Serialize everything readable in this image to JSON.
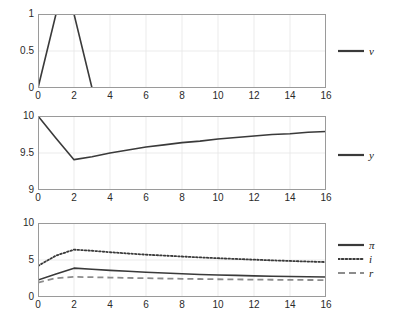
{
  "figure": {
    "background": "#ffffff",
    "line_color": "#3a3a3a",
    "grid_color": "#e6e6e6",
    "axis_color": "#9a9a9a",
    "text_color": "#2a2a2a"
  },
  "chart_data": [
    {
      "type": "line",
      "panel": "top",
      "title": "",
      "xlabel": "",
      "ylabel": "",
      "xlim": [
        0,
        16
      ],
      "ylim": [
        0,
        1
      ],
      "xticks": [
        0,
        2,
        4,
        6,
        8,
        10,
        12,
        14,
        16
      ],
      "yticks": [
        0,
        0.5,
        1
      ],
      "xticklabels": [
        "0",
        "2",
        "4",
        "6",
        "8",
        "10",
        "12",
        "14",
        "16"
      ],
      "yticklabels": [
        "0",
        "0.5",
        "1"
      ],
      "grid": true,
      "legend_position": "right",
      "series": [
        {
          "name": "v",
          "label": "v",
          "style": "solid",
          "color": "#3a3a3a",
          "x": [
            0,
            1,
            2,
            3,
            4,
            5,
            6,
            7,
            8,
            9,
            10,
            11,
            12,
            13,
            14,
            15,
            16
          ],
          "values": [
            0,
            1,
            1,
            0,
            0,
            0,
            0,
            0,
            0,
            0,
            0,
            0,
            0,
            0,
            0,
            0,
            0
          ]
        }
      ]
    },
    {
      "type": "line",
      "panel": "middle",
      "title": "",
      "xlabel": "",
      "ylabel": "",
      "xlim": [
        0,
        16
      ],
      "ylim": [
        9,
        10
      ],
      "xticks": [
        0,
        2,
        4,
        6,
        8,
        10,
        12,
        14,
        16
      ],
      "yticks": [
        9,
        9.5,
        10
      ],
      "xticklabels": [
        "0",
        "2",
        "4",
        "6",
        "8",
        "10",
        "12",
        "14",
        "16"
      ],
      "yticklabels": [
        "9",
        "9.5",
        "10"
      ],
      "grid": true,
      "legend_position": "right",
      "series": [
        {
          "name": "y",
          "label": "y",
          "style": "solid",
          "color": "#3a3a3a",
          "x": [
            0,
            1,
            2,
            3,
            4,
            5,
            6,
            7,
            8,
            9,
            10,
            11,
            12,
            13,
            14,
            15,
            16
          ],
          "values": [
            10.0,
            9.7,
            9.41,
            9.45,
            9.5,
            9.54,
            9.58,
            9.61,
            9.64,
            9.66,
            9.69,
            9.71,
            9.73,
            9.75,
            9.76,
            9.78,
            9.79
          ]
        }
      ]
    },
    {
      "type": "line",
      "panel": "bottom",
      "title": "",
      "xlabel": "",
      "ylabel": "",
      "xlim": [
        0,
        16
      ],
      "ylim": [
        0,
        10
      ],
      "xticks": [
        0,
        2,
        4,
        6,
        8,
        10,
        12,
        14,
        16
      ],
      "yticks": [
        0,
        5,
        10
      ],
      "xticklabels": [
        "0",
        "2",
        "4",
        "6",
        "8",
        "10",
        "12",
        "14",
        "16"
      ],
      "yticklabels": [
        "0",
        "5",
        "10"
      ],
      "grid": true,
      "legend_position": "right",
      "series": [
        {
          "name": "pi",
          "label": "π",
          "style": "solid",
          "color": "#3a3a3a",
          "x": [
            0,
            1,
            2,
            3,
            4,
            5,
            6,
            7,
            8,
            9,
            10,
            11,
            12,
            13,
            14,
            15,
            16
          ],
          "values": [
            2.3,
            3.1,
            3.9,
            3.75,
            3.6,
            3.47,
            3.35,
            3.24,
            3.14,
            3.05,
            2.98,
            2.92,
            2.86,
            2.81,
            2.77,
            2.73,
            2.7
          ]
        },
        {
          "name": "i",
          "label": "i",
          "style": "dotted",
          "color": "#3a3a3a",
          "x": [
            0,
            1,
            2,
            3,
            4,
            5,
            6,
            7,
            8,
            9,
            10,
            11,
            12,
            13,
            14,
            15,
            16
          ],
          "values": [
            4.2,
            5.6,
            6.4,
            6.25,
            6.05,
            5.88,
            5.72,
            5.6,
            5.47,
            5.35,
            5.24,
            5.14,
            5.05,
            4.95,
            4.87,
            4.79,
            4.72
          ]
        },
        {
          "name": "r",
          "label": "r",
          "style": "dashed",
          "color": "#8c8c8c",
          "x": [
            0,
            1,
            2,
            3,
            4,
            5,
            6,
            7,
            8,
            9,
            10,
            11,
            12,
            13,
            14,
            15,
            16
          ],
          "values": [
            1.95,
            2.55,
            2.72,
            2.68,
            2.63,
            2.58,
            2.54,
            2.5,
            2.46,
            2.43,
            2.4,
            2.38,
            2.35,
            2.33,
            2.31,
            2.3,
            2.28
          ]
        }
      ]
    }
  ]
}
